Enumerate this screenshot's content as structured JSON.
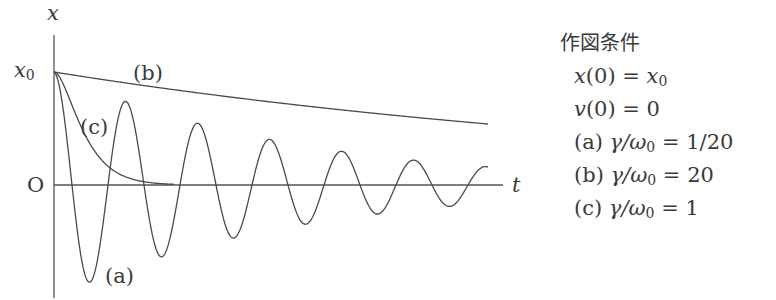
{
  "chart_data": {
    "type": "line",
    "title": "",
    "xlabel": "t",
    "ylabel": "x",
    "y_ticks": [
      {
        "label": "x0",
        "value": 1.0
      },
      {
        "label": "O",
        "value": 0.0
      }
    ],
    "series": [
      {
        "name": "(a)",
        "label": "(a)",
        "gamma_over_omega0": "1/20",
        "description": "underdamped oscillation decaying about 0"
      },
      {
        "name": "(b)",
        "label": "(b)",
        "gamma_over_omega0": "20",
        "description": "overdamped slow monotonic decay"
      },
      {
        "name": "(c)",
        "label": "(c)",
        "gamma_over_omega0": "1",
        "description": "critically damped fast decay to 0"
      }
    ],
    "conditions": {
      "heading": "作図条件",
      "initial": [
        "x(0) = x0",
        "v(0) = 0"
      ],
      "cases": [
        "(a) γ/ω0 = 1/20",
        "(b) γ/ω0 = 20",
        "(c) γ/ω0 = 1"
      ]
    }
  },
  "axes": {
    "y_label": "x",
    "x_label": "t",
    "x0_label": "x",
    "x0_sub": "0",
    "origin_label": "O"
  },
  "curve_labels": {
    "a": "(a)",
    "b": "(b)",
    "c": "(c)"
  },
  "conditions": {
    "heading": "作図条件",
    "line1_var": "x",
    "line1_rest": "(0) = ",
    "line1_rhs": "x",
    "line1_sub": "0",
    "line2_var": "v",
    "line2_rest": "(0) = 0",
    "case_a_prefix": "(a) ",
    "case_a_expr": "γ/ω",
    "case_a_sub": "0",
    "case_a_rhs": " = 1/20",
    "case_b_prefix": "(b) ",
    "case_b_expr": "γ/ω",
    "case_b_sub": "0",
    "case_b_rhs": " = 20",
    "case_c_prefix": "(c) ",
    "case_c_expr": "γ/ω",
    "case_c_sub": "0",
    "case_c_rhs": " = 1"
  },
  "colors": {
    "line": "#4a4a4a",
    "text": "#3a3a3a",
    "background": "#ffffff"
  }
}
